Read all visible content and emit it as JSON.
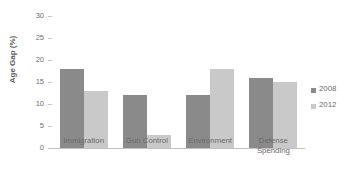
{
  "title": "",
  "chart_data": {
    "type": "bar",
    "title": "",
    "xlabel": "",
    "ylabel": "Age Gap (%)",
    "ylim": [
      0,
      30
    ],
    "yticks": [
      0,
      5,
      10,
      15,
      20,
      25,
      30
    ],
    "ytick_labels": [
      "0",
      "5",
      "10",
      "15",
      "20",
      "25",
      "30"
    ],
    "grid": false,
    "legend_position": "right",
    "categories": [
      "Immigration",
      "Gun Control",
      "Environment",
      "Defense\nSpending"
    ],
    "series": [
      {
        "name": "2008",
        "color": "#8a8a8a",
        "values": [
          18,
          12,
          12,
          16
        ]
      },
      {
        "name": "2012",
        "color": "#c9c9c9",
        "values": [
          13,
          3,
          18,
          15
        ]
      }
    ]
  },
  "legend": {
    "items": [
      {
        "label": "2008"
      },
      {
        "label": "2012"
      }
    ]
  }
}
